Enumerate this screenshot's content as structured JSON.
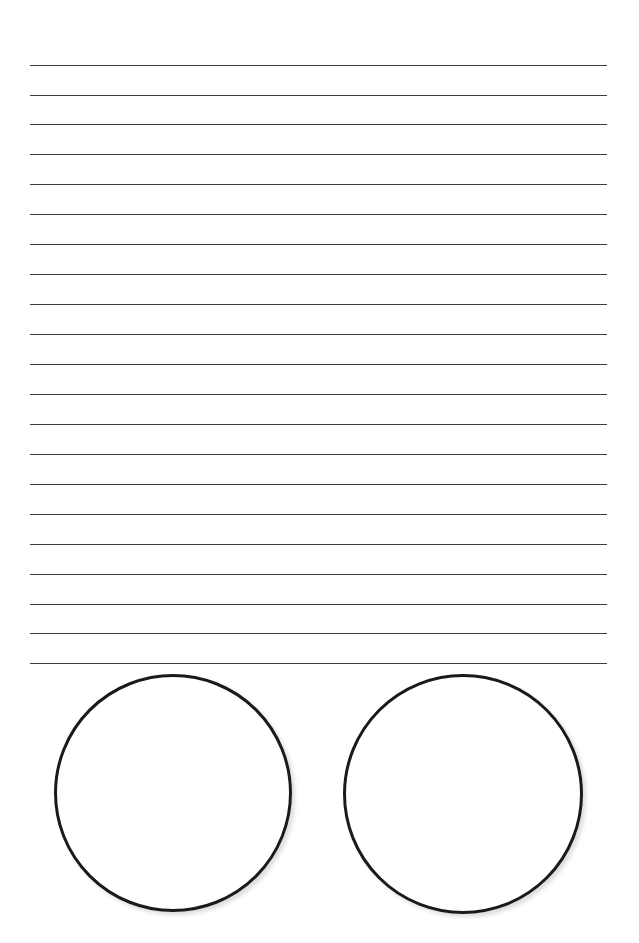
{
  "page": {
    "width": 639,
    "height": 943,
    "background_color": "#ffffff"
  },
  "ruled_lines": {
    "name": "handwriting-practice-lines",
    "count": 21,
    "first_line_y": 65,
    "spacing": 30,
    "left_x": 30,
    "right_x": 607,
    "thickness": 1.6,
    "color": "#3b3b3b",
    "lines": [
      {
        "index": 1,
        "y": 65,
        "x1": 30,
        "x2": 607
      },
      {
        "index": 2,
        "y": 95,
        "x1": 30,
        "x2": 607
      },
      {
        "index": 3,
        "y": 124,
        "x1": 30,
        "x2": 607
      },
      {
        "index": 4,
        "y": 154,
        "x1": 30,
        "x2": 607
      },
      {
        "index": 5,
        "y": 184,
        "x1": 30,
        "x2": 607
      },
      {
        "index": 6,
        "y": 214,
        "x1": 30,
        "x2": 607
      },
      {
        "index": 7,
        "y": 244,
        "x1": 30,
        "x2": 607
      },
      {
        "index": 8,
        "y": 274,
        "x1": 30,
        "x2": 607
      },
      {
        "index": 9,
        "y": 304,
        "x1": 30,
        "x2": 607
      },
      {
        "index": 10,
        "y": 334,
        "x1": 30,
        "x2": 607
      },
      {
        "index": 11,
        "y": 364,
        "x1": 30,
        "x2": 607
      },
      {
        "index": 12,
        "y": 394,
        "x1": 30,
        "x2": 607
      },
      {
        "index": 13,
        "y": 424,
        "x1": 30,
        "x2": 607
      },
      {
        "index": 14,
        "y": 454,
        "x1": 30,
        "x2": 607
      },
      {
        "index": 15,
        "y": 484,
        "x1": 30,
        "x2": 607
      },
      {
        "index": 16,
        "y": 514,
        "x1": 30,
        "x2": 607
      },
      {
        "index": 17,
        "y": 544,
        "x1": 30,
        "x2": 607
      },
      {
        "index": 18,
        "y": 574,
        "x1": 30,
        "x2": 607
      },
      {
        "index": 19,
        "y": 604,
        "x1": 30,
        "x2": 607
      },
      {
        "index": 20,
        "y": 633,
        "x1": 30,
        "x2": 607
      },
      {
        "index": 21,
        "y": 663,
        "x1": 30,
        "x2": 607
      }
    ]
  },
  "circles": {
    "name": "drawing-circles",
    "count": 2,
    "stroke_color": "#1a1a1a",
    "stroke_width": 3,
    "fill_color": "transparent",
    "items": [
      {
        "index": 1,
        "label": "left-circle",
        "cx": 173,
        "cy": 793,
        "r": 119,
        "left": 54,
        "top": 674,
        "diameter": 238
      },
      {
        "index": 2,
        "label": "right-circle",
        "cx": 463,
        "cy": 794,
        "r": 120,
        "left": 343,
        "top": 674,
        "diameter": 240
      }
    ]
  }
}
